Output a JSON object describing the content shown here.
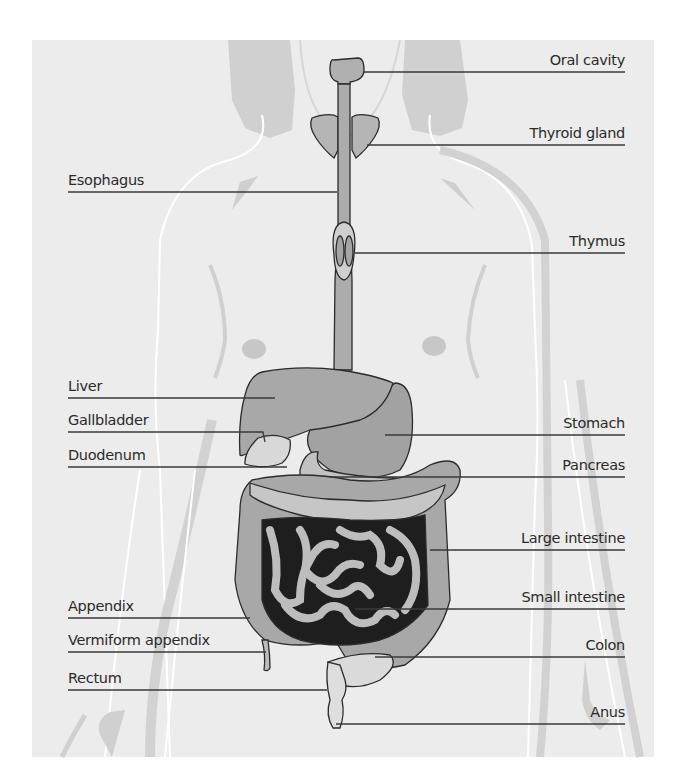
{
  "diagram": {
    "colors": {
      "background": "#ffffff",
      "panel": "#ececec",
      "silhouette": "#d2d2d2",
      "silhouette_outline": "#ffffff",
      "organ_fill": "#a9a9a9",
      "organ_light": "#cfcfcf",
      "organ_outline": "#2b2b2b",
      "leader_line": "#3a3a3a",
      "text": "#2a2a2a"
    },
    "labels_left": [
      {
        "id": "esophagus",
        "text": "Esophagus"
      },
      {
        "id": "liver",
        "text": "Liver"
      },
      {
        "id": "gallbladder",
        "text": "Gallbladder"
      },
      {
        "id": "duodenum",
        "text": "Duodenum"
      },
      {
        "id": "appendix",
        "text": "Appendix"
      },
      {
        "id": "vermiform-appendix",
        "text": "Vermiform appendix"
      },
      {
        "id": "rectum",
        "text": "Rectum"
      }
    ],
    "labels_right": [
      {
        "id": "oral-cavity",
        "text": "Oral cavity"
      },
      {
        "id": "thyroid-gland",
        "text": "Thyroid gland"
      },
      {
        "id": "thymus",
        "text": "Thymus"
      },
      {
        "id": "stomach",
        "text": "Stomach"
      },
      {
        "id": "pancreas",
        "text": "Pancreas"
      },
      {
        "id": "large-intestine",
        "text": "Large intestine"
      },
      {
        "id": "small-intestine",
        "text": "Small intestine"
      },
      {
        "id": "colon",
        "text": "Colon"
      },
      {
        "id": "anus",
        "text": "Anus"
      }
    ]
  }
}
